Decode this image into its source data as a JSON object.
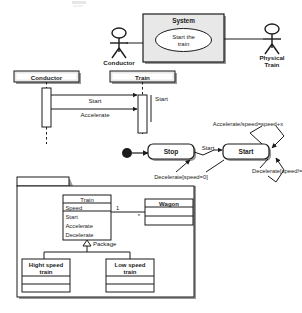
{
  "document": {
    "title": "UML diagrams of a train control system",
    "diagrams": [
      "use-case-diagram",
      "sequence-diagram",
      "state-machine-diagram",
      "class-diagram"
    ]
  },
  "use_case": {
    "system_boundary_label": "System",
    "use_case_label_line1": "Start the",
    "use_case_label_line2": "train",
    "actor_left_label": "Conductor",
    "actor_right_label_line1": "Physical",
    "actor_right_label_line2": "Train"
  },
  "sequence": {
    "lifelines": [
      {
        "label": "Conductor"
      },
      {
        "label": "Train"
      }
    ],
    "messages": [
      {
        "label": "Start"
      },
      {
        "label": "Accelerate"
      }
    ],
    "self_message_label": "Start"
  },
  "state_machine": {
    "initial_state": "initial-node",
    "states": [
      {
        "label": "Stop"
      },
      {
        "label": "Start"
      }
    ],
    "transitions": [
      {
        "label": "Start"
      },
      {
        "label": "Decelerate[speed=0]"
      },
      {
        "label": "Accelerate/speed=speed+x"
      },
      {
        "label": "Decelerate[speed!=0]"
      }
    ]
  },
  "class_diagram": {
    "package_label": "",
    "generalization_label": "Package",
    "classes": [
      {
        "name": "Train",
        "attributes": [
          "Speed"
        ],
        "operations": [
          "Start",
          "Accelerate",
          "Decelerate"
        ]
      },
      {
        "name": "Wagon",
        "attributes": [],
        "operations": []
      },
      {
        "name": "Hight speed\ntrain",
        "name_line1": "Hight speed",
        "name_line2": "train",
        "attributes": [],
        "operations": []
      },
      {
        "name": "Low speed\ntrain",
        "name_line1": "Low speed",
        "name_line2": "train",
        "attributes": [],
        "operations": []
      }
    ],
    "multiplicity_source": "1",
    "multiplicity_target": "*"
  },
  "colors": {
    "stroke": "#1b1b1b",
    "fill_white": "#ffffff",
    "fill_grey": "#e8e8e8",
    "fill_light": "#f2f2f2",
    "shadow": "#9a9a9a",
    "text": "#1b1b1b"
  }
}
